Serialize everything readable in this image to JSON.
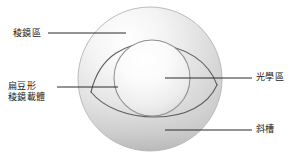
{
  "figure": {
    "name": "prism-ballast-contact-lens-cross-section",
    "background_color": "#ffffff",
    "line_color": "#4a4a4a",
    "leader_color": "#2b2b2b",
    "text_color": "#1b1b1b"
  },
  "labels": {
    "prism_zone": "稜鏡區",
    "lenticular_carrier_line1": "扁豆形",
    "lenticular_carrier_line2": "稜鏡載體",
    "optic_zone": "光學區",
    "slot": "斜槽"
  },
  "shapes": {
    "outer_circle": {
      "cx": 150,
      "cy": 79,
      "r": 72,
      "fill_light": "#fdfdfd",
      "fill_dark": "#c3c3c3",
      "stroke": "#b9b9b9"
    },
    "optic_zone_circle": {
      "cx": 152,
      "cy": 78,
      "r": 38,
      "fill_light": "#ffffff",
      "fill_dark": "#cfcfcf",
      "stroke": "#9a9a9a"
    },
    "lenticular_lens": {
      "left_x": 92,
      "right_x": 216,
      "mid_y": 80,
      "top_y": 45,
      "bottom_y": 117,
      "stroke": "#5c5c5c"
    }
  },
  "leaders": [
    {
      "name": "leader-prism-zone",
      "x1": 48,
      "y1": 33,
      "x2": 126,
      "y2": 33
    },
    {
      "name": "leader-lenticular-carrier",
      "x1": 57,
      "y1": 87,
      "x2": 118,
      "y2": 87
    },
    {
      "name": "leader-optic-zone",
      "x1": 165,
      "y1": 78,
      "x2": 252,
      "y2": 78
    },
    {
      "name": "leader-slot",
      "x1": 165,
      "y1": 130,
      "x2": 252,
      "y2": 130
    }
  ]
}
